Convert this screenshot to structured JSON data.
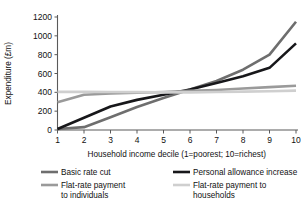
{
  "chart_data": {
    "type": "line",
    "title": "",
    "xlabel": "Household income decile (1=poorest; 10=richest)",
    "ylabel": "Expenditure (£m)",
    "x": [
      1,
      2,
      3,
      4,
      5,
      6,
      7,
      8,
      9,
      10
    ],
    "xtick_labels": [
      "1",
      "2",
      "3",
      "4",
      "5",
      "6",
      "7",
      "8",
      "9",
      "10"
    ],
    "ytick_labels": [
      "0",
      "200",
      "400",
      "600",
      "800",
      "1000",
      "1200"
    ],
    "ytick_values": [
      0,
      200,
      400,
      600,
      800,
      1000,
      1200
    ],
    "xlim": [
      1,
      10
    ],
    "ylim": [
      0,
      1200
    ],
    "grid": false,
    "legend_position": "bottom",
    "series": [
      {
        "name": "Basic rate cut",
        "color": "#6e6e6e",
        "width": 2.6,
        "values": [
          10,
          30,
          135,
          245,
          340,
          430,
          520,
          640,
          800,
          1150
        ]
      },
      {
        "name": "Personal allowance increase",
        "color": "#17171a",
        "width": 2.6,
        "values": [
          10,
          130,
          250,
          320,
          375,
          430,
          500,
          570,
          660,
          920
        ]
      },
      {
        "name": "Flat-rate payment to individuals",
        "color": "#9a9a9a",
        "width": 2.6,
        "values": [
          295,
          375,
          388,
          395,
          403,
          415,
          425,
          440,
          455,
          470
        ]
      },
      {
        "name": "Flat-rate payment to households",
        "color": "#cfcfcf",
        "width": 2.6,
        "values": [
          405,
          405,
          403,
          402,
          400,
          400,
          403,
          408,
          412,
          418
        ]
      }
    ]
  },
  "legend": {
    "entries": [
      {
        "label": "Basic rate cut",
        "color": "#6e6e6e"
      },
      {
        "label": "Personal allowance increase",
        "color": "#17171a"
      },
      {
        "label": "Flat-rate payment",
        "label2": "to individuals",
        "color": "#9a9a9a"
      },
      {
        "label": "Flat-rate payment to",
        "label2": "households",
        "color": "#cfcfcf"
      }
    ]
  },
  "axes": {
    "y_title": "Expenditure (£m)",
    "x_title": "Household income decile (1=poorest; 10=richest)"
  }
}
